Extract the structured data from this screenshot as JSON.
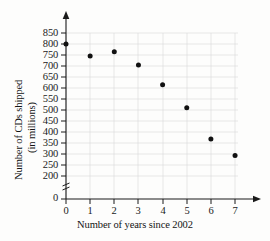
{
  "chart_data": {
    "type": "scatter",
    "title": "",
    "xlabel": "Number of years since 2002",
    "ylabel_line1": "Number of CDs shipped",
    "ylabel_line2": "(in millions)",
    "x": [
      0,
      1,
      2,
      3,
      4,
      5,
      6,
      7
    ],
    "values": [
      800,
      745,
      765,
      705,
      615,
      510,
      368,
      293
    ],
    "points": [
      {
        "x": 0,
        "y": 800
      },
      {
        "x": 1,
        "y": 745
      },
      {
        "x": 2,
        "y": 765
      },
      {
        "x": 3,
        "y": 705
      },
      {
        "x": 4,
        "y": 615
      },
      {
        "x": 5,
        "y": 510
      },
      {
        "x": 6,
        "y": 368
      },
      {
        "x": 7,
        "y": 293
      }
    ],
    "xticks": [
      "0",
      "1",
      "2",
      "3",
      "4",
      "5",
      "6",
      "7"
    ],
    "yticks": [
      "0",
      "200",
      "250",
      "300",
      "350",
      "400",
      "450",
      "500",
      "550",
      "600",
      "650",
      "700",
      "750",
      "800",
      "850"
    ],
    "xlim": [
      0,
      7.6
    ],
    "ylim": [
      200,
      850
    ],
    "y_axis_break": true,
    "y_axis_break_between": [
      0,
      200
    ],
    "grid": true,
    "legend": "none",
    "marker_color": "#111111",
    "grid_color": "#d8d8d8",
    "axis_color": "#1a1a1a"
  }
}
